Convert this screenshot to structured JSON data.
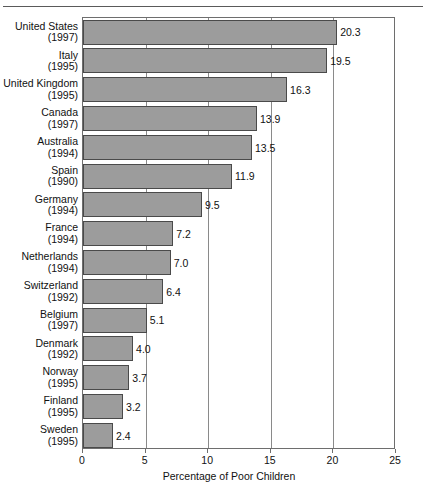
{
  "figure": {
    "kind": "horizontal-bar-chart",
    "bar_fill_color": "#9c9c9c",
    "bar_border_color": "#4a4a4a",
    "axis_color": "#6e6e6e"
  },
  "chart_data": {
    "type": "bar",
    "orientation": "horizontal",
    "title": "",
    "xlabel": "Percentage of Poor Children",
    "ylabel": "",
    "xlim": [
      0,
      25
    ],
    "xticks": [
      0,
      5,
      10,
      15,
      20,
      25
    ],
    "xticklabels": [
      "0",
      "5",
      "10",
      "15",
      "20",
      "25"
    ],
    "gridlines": [
      5,
      10,
      15,
      20
    ],
    "grid": true,
    "legend": null,
    "categories": [
      "United States",
      "Italy",
      "United Kingdom",
      "Canada",
      "Australia",
      "Spain",
      "Germany",
      "France",
      "Netherlands",
      "Switzerland",
      "Belgium",
      "Denmark",
      "Norway",
      "Finland",
      "Sweden"
    ],
    "years": [
      "(1997)",
      "(1995)",
      "(1995)",
      "(1997)",
      "(1994)",
      "(1990)",
      "(1994)",
      "(1994)",
      "(1994)",
      "(1992)",
      "(1997)",
      "(1992)",
      "(1995)",
      "(1995)",
      "(1995)"
    ],
    "values": [
      20.3,
      19.5,
      16.3,
      13.9,
      13.5,
      11.9,
      9.5,
      7.2,
      7.0,
      6.4,
      5.1,
      4.0,
      3.7,
      3.2,
      2.4
    ],
    "value_labels": [
      "20.3",
      "19.5",
      "16.3",
      "13.9",
      "13.5",
      "11.9",
      "9.5",
      "7.2",
      "7.0",
      "6.4",
      "5.1",
      "4.0",
      "3.7",
      "3.2",
      "2.4"
    ]
  }
}
